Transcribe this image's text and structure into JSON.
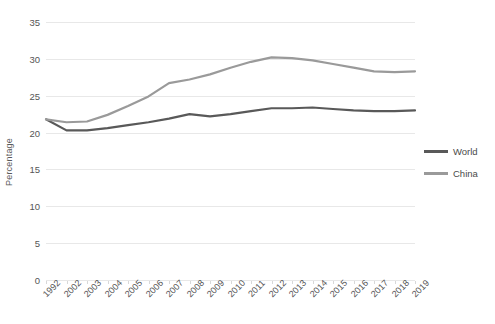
{
  "chart_data": {
    "type": "line",
    "title": "",
    "xlabel": "",
    "ylabel": "Percentage",
    "ylim": [
      0,
      35
    ],
    "yticks": [
      0,
      5,
      10,
      15,
      20,
      25,
      30,
      35
    ],
    "grid": true,
    "legend_position": "right",
    "categories": [
      "1992",
      "2002",
      "2003",
      "2004",
      "2005",
      "2006",
      "2007",
      "2008",
      "2009",
      "2010",
      "2011",
      "2012",
      "2013",
      "2014",
      "2015",
      "2016",
      "2017",
      "2018",
      "2019"
    ],
    "series": [
      {
        "name": "World",
        "color": "#595959",
        "values": [
          21.8,
          20.3,
          20.3,
          20.6,
          21.0,
          21.4,
          21.9,
          22.5,
          22.2,
          22.5,
          22.9,
          23.3,
          23.3,
          23.4,
          23.2,
          23.0,
          22.9,
          22.9,
          23.0
        ]
      },
      {
        "name": "China",
        "color": "#9a9a9a",
        "values": [
          21.8,
          21.4,
          21.5,
          22.4,
          23.6,
          24.9,
          26.7,
          27.2,
          27.9,
          28.8,
          29.6,
          30.2,
          30.1,
          29.8,
          29.3,
          28.8,
          28.3,
          28.2,
          28.3
        ]
      }
    ]
  },
  "legend": {
    "items": [
      {
        "label": "World",
        "color": "#595959"
      },
      {
        "label": "China",
        "color": "#9a9a9a"
      }
    ]
  },
  "axis": {
    "y_title": "Percentage"
  }
}
